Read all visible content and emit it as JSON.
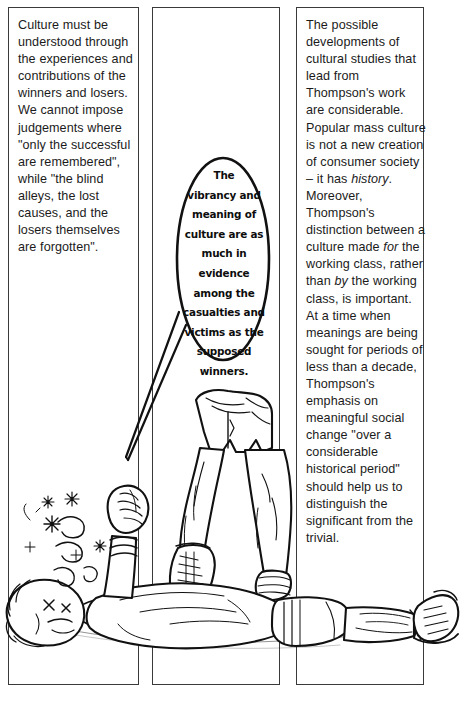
{
  "page": {
    "kind": "comic-page",
    "background_color": "#ffffff",
    "ink_color": "#1b1b1b",
    "width": 461,
    "height": 705
  },
  "columns": [
    {
      "id": "column-left",
      "text": "Culture must be understood through the experiences and contributions of the winners and losers. We cannot impose judgements where \"only the successful are remembered\", while \"the blind alleys, the lost causes, and the losers themselves are forgotten\"."
    },
    {
      "id": "column-middle",
      "text": ""
    },
    {
      "id": "column-right",
      "text_runs": [
        {
          "style": "normal",
          "text": "The possible developments of cultural studies that lead from Thompson's work are considerable. Popular mass culture is not a new creation of consumer society – it has "
        },
        {
          "style": "italic",
          "text": "history"
        },
        {
          "style": "normal",
          "text": ". Moreover, Thompson's distinction between a culture made "
        },
        {
          "style": "italic",
          "text": "for"
        },
        {
          "style": "normal",
          "text": " the working class, rather than "
        },
        {
          "style": "italic",
          "text": "by"
        },
        {
          "style": "normal",
          "text": " the working class, is important. At a time when meanings are being sought for periods of less than a decade, Thompson's emphasis on meaningful social change \"over a considerable historical period\" should help us to distinguish the significant from the trivial."
        }
      ]
    }
  ],
  "balloon": {
    "speaker": "standing-figure",
    "lines": [
      "The",
      "vibrancy and",
      "meaning of",
      "culture are as",
      "much in evidence",
      "among the",
      "casualties and",
      "victims as the",
      "supposed",
      "winners."
    ]
  },
  "illustration": {
    "description": "Line-drawn cartoon: a victorious figure in shorts and lace-up boots stands with one boot planted on a knocked-out figure lying flat on the ground; the fallen figure's raised fist, dazed stars and swirls appear near the head.",
    "elements": [
      {
        "name": "standing-figure-legs",
        "note": "bare legs in shorts, laced boots"
      },
      {
        "name": "fallen-figure-body",
        "note": "lying prone across the page, boots at far right"
      },
      {
        "name": "fallen-figure-fist",
        "note": "raised clenched fist"
      },
      {
        "name": "dazed-stars",
        "note": "stars and spiral squiggles beside the head"
      },
      {
        "name": "balloon-tail",
        "note": "long thin tail running down-left from balloon"
      }
    ]
  }
}
